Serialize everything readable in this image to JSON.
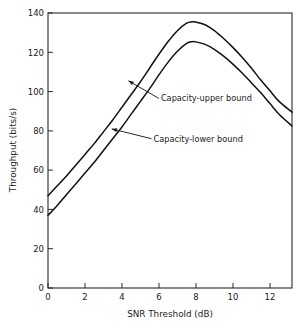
{
  "chart_data": {
    "type": "line",
    "title": "",
    "xlabel": "SNR Threshold (dB)",
    "ylabel": "Throughput (bits/s)",
    "xlim": [
      0,
      13.2
    ],
    "ylim": [
      0,
      140
    ],
    "xticks": [
      0,
      2,
      4,
      6,
      8,
      10,
      12
    ],
    "xtick_labels": [
      "0",
      "2",
      "4",
      "6",
      "8",
      "10",
      "12"
    ],
    "yticks": [
      0,
      20,
      40,
      60,
      80,
      100,
      120,
      140
    ],
    "ytick_labels": [
      "0",
      "20",
      "40",
      "60",
      "80",
      "100",
      "120",
      "140"
    ],
    "grid": false,
    "legend": "none",
    "frame": "box",
    "line_color": "#111111",
    "x": [
      0,
      0.5,
      1,
      1.5,
      2,
      2.5,
      3,
      3.5,
      4,
      4.5,
      5,
      5.5,
      6,
      6.5,
      7,
      7.5,
      7.8,
      8,
      8.5,
      9,
      9.5,
      10,
      10.5,
      11,
      11.5,
      12,
      12.5,
      13.2
    ],
    "series": [
      {
        "name": "Capacity-upper bound",
        "values": [
          47,
          52,
          57,
          62.5,
          68,
          73.5,
          79.5,
          85.5,
          92,
          98.5,
          105,
          112,
          119,
          125.5,
          131,
          134.8,
          135.5,
          135.4,
          134,
          131,
          127,
          122.5,
          117.5,
          112,
          106,
          100.5,
          95,
          89.5
        ]
      },
      {
        "name": "Capacity-lower bound",
        "values": [
          37,
          42,
          47.5,
          53,
          58.5,
          64,
          70,
          76,
          82,
          88.5,
          95,
          101.5,
          108.5,
          115,
          120.5,
          124.5,
          125.4,
          125.3,
          124,
          121.5,
          118,
          114,
          109.5,
          104.5,
          99.5,
          94,
          88.5,
          82.5
        ]
      }
    ],
    "annotations": [
      {
        "text": "Capacity-upper bound",
        "target_x": 4.35,
        "target_y": 105.5,
        "label_x": 6.0,
        "label_y": 96.5
      },
      {
        "text": "Capacity-lower bound",
        "target_x": 3.45,
        "target_y": 81.0,
        "label_x": 5.6,
        "label_y": 76.0
      }
    ]
  }
}
